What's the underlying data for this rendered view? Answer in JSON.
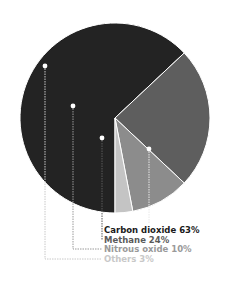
{
  "chart_data": {
    "type": "pie",
    "title": "",
    "categories": [
      "Carbon dioxide",
      "Methane",
      "Nitrous oxide",
      "Others"
    ],
    "values": [
      63,
      24,
      10,
      3
    ],
    "unit": "%",
    "colors": [
      "#232323",
      "#5e5e5e",
      "#8c8c8c",
      "#c4c4c4"
    ],
    "legend_position": "bottom-center",
    "labels": [
      {
        "name": "Carbon dioxide",
        "text": "Carbon dioxide 63%",
        "color": "#1a1a1a"
      },
      {
        "name": "Methane",
        "text": "Methane 24%",
        "color": "#5a5a5a"
      },
      {
        "name": "Nitrous oxide",
        "text": "Nitrous oxide 10%",
        "color": "#9a9a9a"
      },
      {
        "name": "Others",
        "text": "Others 3%",
        "color": "#c8c8c8"
      }
    ]
  }
}
